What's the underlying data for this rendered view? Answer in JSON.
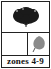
{
  "card": {
    "top_icon": "shrub-icon",
    "mid_left": "",
    "mid_right_icon": "leaf-icon",
    "zones_label": "zones 4-9"
  },
  "colors": {
    "border": "#222222",
    "shrub": "#1a1a1a",
    "leaf": "#8a8a8a"
  }
}
